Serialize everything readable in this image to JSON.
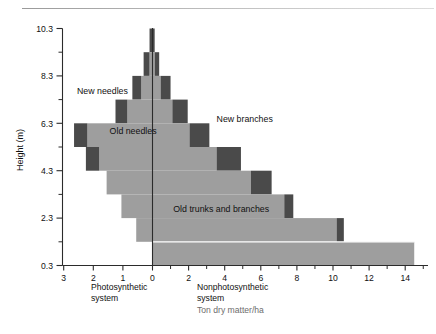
{
  "chart_data": {
    "type": "bar",
    "orientation": "horizontal-pyramid",
    "title": "",
    "xlabel_left": "Photosynthetic system",
    "xlabel_right": "Nonphotosynthetic system",
    "units": "Ton dry matter/ha",
    "ylabel": "Height (m)",
    "ylim": [
      0.3,
      10.3
    ],
    "yticks": [
      0.3,
      2.3,
      4.3,
      6.3,
      8.3,
      10.3
    ],
    "ytick_labels": [
      "0.3",
      "2.3",
      "4.3",
      "6.3",
      "8.3",
      "10.3"
    ],
    "yminor_step": 1,
    "xlim_left": [
      0,
      3
    ],
    "xticks_left": [
      3,
      2,
      1,
      0
    ],
    "xtick_labels_left": [
      "3",
      "2",
      "1",
      "0"
    ],
    "xlim_right": [
      0,
      15
    ],
    "xticks_right": [
      0,
      2,
      4,
      6,
      8,
      10,
      12,
      14
    ],
    "xtick_labels_right": [
      "0",
      "2",
      "4",
      "6",
      "8",
      "10",
      "12",
      "14"
    ],
    "grid": false,
    "legend_position": "inline-annotations",
    "annotations": [
      {
        "text": "New needles",
        "x": -2.55,
        "y": 7.55
      },
      {
        "text": "Old needles",
        "x": -1.45,
        "y": 5.85
      },
      {
        "text": "New branches",
        "x": 3.55,
        "y": 6.35
      },
      {
        "text": "Old trunks and branches",
        "x": 1.15,
        "y": 2.55
      }
    ],
    "colors": {
      "old_tissue": "#9e9e9e",
      "new_tissue": "#4a4a4a",
      "axis": "#2b2b2b",
      "background": "#ffffff",
      "separator": "#ffffff"
    },
    "series": [
      {
        "name": "Old needles (photosynthetic, old tissue)",
        "side": "left",
        "color": "#9e9e9e"
      },
      {
        "name": "New needles (photosynthetic, new tissue)",
        "side": "left",
        "color": "#4a4a4a"
      },
      {
        "name": "Old trunks and branches (nonphotosynthetic, old tissue)",
        "side": "right",
        "color": "#9e9e9e"
      },
      {
        "name": "New branches (nonphotosynthetic, new tissue)",
        "side": "right",
        "color": "#4a4a4a"
      }
    ],
    "layers_left": [
      {
        "y_bottom": 9.3,
        "y_top": 10.3,
        "old": 0.0,
        "new": 0.1
      },
      {
        "y_bottom": 8.3,
        "y_top": 9.3,
        "old": 0.1,
        "new": 0.2
      },
      {
        "y_bottom": 7.3,
        "y_top": 8.3,
        "old": 0.38,
        "new": 0.3
      },
      {
        "y_bottom": 6.3,
        "y_top": 7.3,
        "old": 0.85,
        "new": 0.4
      },
      {
        "y_bottom": 5.3,
        "y_top": 6.3,
        "old": 2.2,
        "new": 0.45
      },
      {
        "y_bottom": 4.3,
        "y_top": 5.3,
        "old": 1.8,
        "new": 0.45
      },
      {
        "y_bottom": 3.3,
        "y_top": 4.3,
        "old": 1.55,
        "new": 0.0
      },
      {
        "y_bottom": 2.3,
        "y_top": 3.3,
        "old": 1.05,
        "new": 0.0
      },
      {
        "y_bottom": 1.3,
        "y_top": 2.3,
        "old": 0.55,
        "new": 0.0
      },
      {
        "y_bottom": 0.3,
        "y_top": 1.3,
        "old": 0.0,
        "new": 0.0
      }
    ],
    "layers_right": [
      {
        "y_bottom": 9.3,
        "y_top": 10.3,
        "old": 0.0,
        "new": 0.12
      },
      {
        "y_bottom": 8.3,
        "y_top": 9.3,
        "old": 0.12,
        "new": 0.25
      },
      {
        "y_bottom": 7.3,
        "y_top": 8.3,
        "old": 0.45,
        "new": 0.55
      },
      {
        "y_bottom": 6.3,
        "y_top": 7.3,
        "old": 1.1,
        "new": 0.85
      },
      {
        "y_bottom": 5.3,
        "y_top": 6.3,
        "old": 2.05,
        "new": 1.1
      },
      {
        "y_bottom": 4.3,
        "y_top": 5.3,
        "old": 3.55,
        "new": 1.35
      },
      {
        "y_bottom": 3.3,
        "y_top": 4.3,
        "old": 5.45,
        "new": 1.15
      },
      {
        "y_bottom": 2.3,
        "y_top": 3.3,
        "old": 7.3,
        "new": 0.5
      },
      {
        "y_bottom": 1.3,
        "y_top": 2.3,
        "old": 10.2,
        "new": 0.4
      },
      {
        "y_bottom": 0.3,
        "y_top": 1.3,
        "old": 14.5,
        "new": 0.0
      }
    ]
  }
}
